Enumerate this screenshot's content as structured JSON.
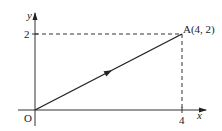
{
  "diagram": {
    "type": "vector-on-coordinate-plane",
    "axes": {
      "x_label": "x",
      "y_label": "y",
      "origin_label": "O"
    },
    "ticks": {
      "x_tick_label": "4",
      "y_tick_label": "2"
    },
    "point": {
      "label": "A(4, 2)",
      "x": 4,
      "y": 2
    },
    "vector": {
      "from": "O",
      "to": "A",
      "direction": "O to A"
    },
    "guides": {
      "style": "dashed",
      "horizontal": "y = 2 from y-axis to A",
      "vertical": "x = 4 from A to x-axis"
    },
    "colors": {
      "line": "#222222",
      "background": "#ffffff"
    }
  }
}
